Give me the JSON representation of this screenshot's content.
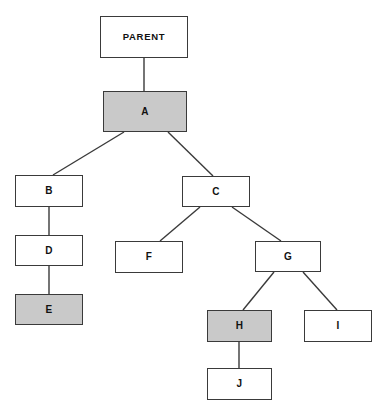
{
  "diagram": {
    "type": "tree",
    "canvas": {
      "width": 390,
      "height": 420
    },
    "background_color": "#ffffff",
    "node_fill_color": "#ffffff",
    "node_highlight_color": "#c9c9c9",
    "node_border_color": "#3a3a3a",
    "edge_color": "#3a3a3a",
    "nodes": [
      {
        "id": "parent",
        "label": "PARENT",
        "x": 100,
        "y": 16,
        "w": 88,
        "h": 42,
        "highlight": false,
        "wide": true
      },
      {
        "id": "a",
        "label": "A",
        "x": 103,
        "y": 91,
        "w": 84,
        "h": 41,
        "highlight": true,
        "wide": false
      },
      {
        "id": "b",
        "label": "B",
        "x": 15,
        "y": 175,
        "w": 68,
        "h": 32,
        "highlight": false,
        "wide": false
      },
      {
        "id": "c",
        "label": "C",
        "x": 182,
        "y": 176,
        "w": 68,
        "h": 31,
        "highlight": false,
        "wide": false
      },
      {
        "id": "d",
        "label": "D",
        "x": 15,
        "y": 235,
        "w": 68,
        "h": 31,
        "highlight": false,
        "wide": false
      },
      {
        "id": "f",
        "label": "F",
        "x": 115,
        "y": 241,
        "w": 68,
        "h": 32,
        "highlight": false,
        "wide": false
      },
      {
        "id": "g",
        "label": "G",
        "x": 255,
        "y": 241,
        "w": 66,
        "h": 31,
        "highlight": false,
        "wide": false
      },
      {
        "id": "e",
        "label": "E",
        "x": 15,
        "y": 294,
        "w": 68,
        "h": 31,
        "highlight": true,
        "wide": false
      },
      {
        "id": "h",
        "label": "H",
        "x": 207,
        "y": 310,
        "w": 65,
        "h": 32,
        "highlight": true,
        "wide": false
      },
      {
        "id": "i",
        "label": "I",
        "x": 304,
        "y": 310,
        "w": 68,
        "h": 32,
        "highlight": false,
        "wide": false
      },
      {
        "id": "j",
        "label": "J",
        "x": 207,
        "y": 368,
        "w": 65,
        "h": 32,
        "highlight": false,
        "wide": false
      }
    ],
    "edges": [
      {
        "from": "parent",
        "to": "a",
        "x1": 144,
        "y1": 58,
        "x2": 144,
        "y2": 91
      },
      {
        "from": "a",
        "to": "b",
        "x1": 124,
        "y1": 132,
        "x2": 53,
        "y2": 175
      },
      {
        "from": "a",
        "to": "c",
        "x1": 168,
        "y1": 132,
        "x2": 213,
        "y2": 176
      },
      {
        "from": "b",
        "to": "d",
        "x1": 49,
        "y1": 207,
        "x2": 49,
        "y2": 235
      },
      {
        "from": "d",
        "to": "e",
        "x1": 49,
        "y1": 266,
        "x2": 49,
        "y2": 294
      },
      {
        "from": "c",
        "to": "f",
        "x1": 200,
        "y1": 207,
        "x2": 160,
        "y2": 241
      },
      {
        "from": "c",
        "to": "g",
        "x1": 232,
        "y1": 207,
        "x2": 281,
        "y2": 241
      },
      {
        "from": "g",
        "to": "h",
        "x1": 274,
        "y1": 272,
        "x2": 243,
        "y2": 310
      },
      {
        "from": "g",
        "to": "i",
        "x1": 303,
        "y1": 272,
        "x2": 337,
        "y2": 310
      },
      {
        "from": "h",
        "to": "j",
        "x1": 239,
        "y1": 342,
        "x2": 239,
        "y2": 368
      }
    ]
  }
}
